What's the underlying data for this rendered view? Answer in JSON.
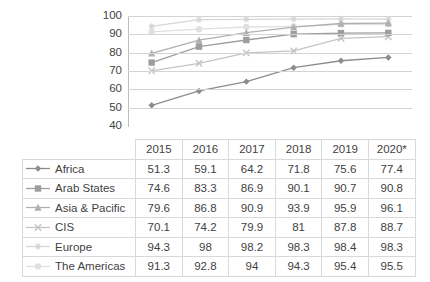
{
  "chart_data": {
    "type": "line",
    "title": "",
    "xlabel": "",
    "ylabel": "",
    "ylim": [
      40,
      100
    ],
    "ytick_step": 10,
    "yticks": [
      100,
      90,
      80,
      70,
      60,
      50,
      40
    ],
    "grid": true,
    "legend_position": "table-left",
    "categories": [
      "2015",
      "2016",
      "2017",
      "2018",
      "2019",
      "2020*"
    ],
    "series": [
      {
        "name": "Africa",
        "marker": "diamond",
        "color": "#8c8c8c",
        "values": [
          51.3,
          59.1,
          64.2,
          71.8,
          75.6,
          77.4
        ]
      },
      {
        "name": "Arab States",
        "marker": "square",
        "color": "#9e9e9e",
        "values": [
          74.6,
          83.3,
          86.9,
          90.1,
          90.7,
          90.8
        ]
      },
      {
        "name": "Asia & Pacific",
        "marker": "triangle",
        "color": "#b0b0b0",
        "values": [
          79.6,
          86.8,
          90.9,
          93.9,
          95.9,
          96.1
        ]
      },
      {
        "name": "CIS",
        "marker": "x",
        "color": "#c4c4c4",
        "values": [
          70.1,
          74.2,
          79.9,
          81,
          87.8,
          88.7
        ]
      },
      {
        "name": "Europe",
        "marker": "star",
        "color": "#d6d6d6",
        "values": [
          94.3,
          98,
          98.2,
          98.3,
          98.4,
          98.3
        ]
      },
      {
        "name": "The Americas",
        "marker": "circle",
        "color": "#e0e0e0",
        "values": [
          91.3,
          92.8,
          94,
          94.3,
          95.4,
          95.5
        ]
      }
    ]
  },
  "table": {
    "corner_label": "",
    "columns": [
      "2015",
      "2016",
      "2017",
      "2018",
      "2019",
      "2020*"
    ],
    "rows": [
      {
        "label": "Africa",
        "values": [
          "51.3",
          "59.1",
          "64.2",
          "71.8",
          "75.6",
          "77.4"
        ]
      },
      {
        "label": "Arab States",
        "values": [
          "74.6",
          "83.3",
          "86.9",
          "90.1",
          "90.7",
          "90.8"
        ]
      },
      {
        "label": "Asia & Pacific",
        "values": [
          "79.6",
          "86.8",
          "90.9",
          "93.9",
          "95.9",
          "96.1"
        ]
      },
      {
        "label": "CIS",
        "values": [
          "70.1",
          "74.2",
          "79.9",
          "81",
          "87.8",
          "88.7"
        ]
      },
      {
        "label": "Europe",
        "values": [
          "94.3",
          "98",
          "98.2",
          "98.3",
          "98.4",
          "98.3"
        ]
      },
      {
        "label": "The Americas",
        "values": [
          "91.3",
          "92.8",
          "94",
          "94.3",
          "95.4",
          "95.5"
        ]
      }
    ]
  },
  "colors": {
    "gridline": "#d4d4d4",
    "axis": "#bdbdbd",
    "table_border": "#d9d9d9",
    "text": "#3f3f3f",
    "background": "#ffffff"
  }
}
